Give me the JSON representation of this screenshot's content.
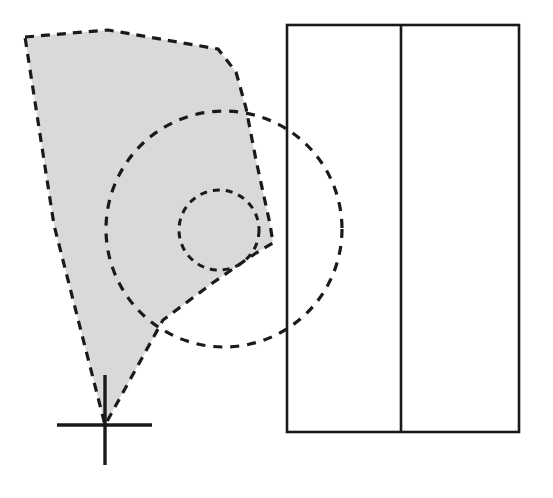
{
  "figure": {
    "width": 553,
    "height": 498,
    "background_color": "#ffffff",
    "stroke_color": "#1a1a1a",
    "fill_color": "#d8d8d8"
  },
  "shapes": {
    "shaded_polygon": {
      "name": "shaded-wedge-polygon",
      "style": "dashed-outline filled",
      "fill": "#d9d9d9",
      "stroke": "#1a1a1a",
      "stroke_width": 3.2,
      "dash_pattern": "9 7",
      "points": "25,37 108,30 218,49 236,72 246,108 256,160 270,224 273,243 256,253 214,282 163,320 105,425 54,225 25,37",
      "vertices": [
        {
          "label": "top-left",
          "x": 25,
          "y": 37
        },
        {
          "label": "top-mid",
          "x": 108,
          "y": 30
        },
        {
          "label": "top-right",
          "x": 218,
          "y": 49
        },
        {
          "label": "right-upper",
          "x": 246,
          "y": 108
        },
        {
          "label": "right-mid",
          "x": 270,
          "y": 224
        },
        {
          "label": "right-notch",
          "x": 273,
          "y": 243
        },
        {
          "label": "lower-right",
          "x": 214,
          "y": 282
        },
        {
          "label": "apex",
          "x": 105,
          "y": 425
        }
      ]
    },
    "large_dashed_circle": {
      "name": "large-dashed-circle",
      "style": "dashed-outline no-fill",
      "stroke": "#1a1a1a",
      "stroke_width": 3.2,
      "dash_pattern": "9 8",
      "cx": 224,
      "cy": 229,
      "r": 118
    },
    "small_dashed_circle": {
      "name": "small-dashed-circle",
      "style": "dashed-outline no-fill",
      "stroke": "#1a1a1a",
      "stroke_width": 3.0,
      "dash_pattern": "7 6",
      "cx": 219,
      "cy": 230,
      "r": 40
    },
    "rectangle_frame": {
      "name": "rectangle-frame",
      "style": "solid-outline no-fill",
      "stroke": "#1a1a1a",
      "stroke_width": 2.6,
      "x": 287,
      "y": 25,
      "width": 232,
      "height": 407
    },
    "rectangle_divider": {
      "name": "rectangle-vertical-divider",
      "style": "solid-line",
      "stroke": "#1a1a1a",
      "stroke_width": 2.6,
      "x": 401,
      "y1": 25,
      "y2": 432
    },
    "cross_marker": {
      "name": "cross-marker",
      "style": "solid-cross",
      "stroke": "#1a1a1a",
      "stroke_width": 3.4,
      "cx": 105,
      "cy": 425,
      "horizontal_x1": 57,
      "horizontal_x2": 152,
      "vertical_y1": 375,
      "vertical_y2": 465
    }
  }
}
